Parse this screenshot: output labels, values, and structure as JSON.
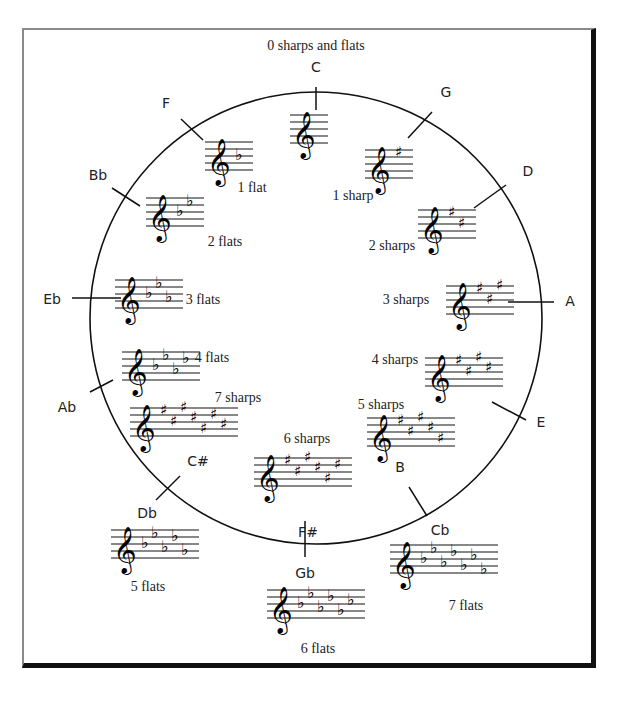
{
  "title": "0 sharps and flats",
  "circle": {
    "cx": 316,
    "cy": 318,
    "r": 226,
    "stroke": "#111111"
  },
  "keys": [
    {
      "name": "C",
      "label_x": 316,
      "label_y": 72,
      "tick": [
        316,
        87,
        316,
        110
      ],
      "staff_x": 290,
      "staff_y": 115,
      "acc_type": "none",
      "acc_count": 0,
      "count_label": "",
      "count_x": 0,
      "count_y": 0
    },
    {
      "name": "G",
      "label_x": 446,
      "label_y": 97,
      "tick": [
        432,
        112,
        408,
        138
      ],
      "staff_x": 365,
      "staff_y": 150,
      "acc_type": "sharp",
      "acc_count": 1,
      "count_label": "1 sharp",
      "count_x": 353,
      "count_y": 200
    },
    {
      "name": "D",
      "label_x": 528,
      "label_y": 176,
      "tick": [
        506,
        185,
        474,
        208
      ],
      "staff_x": 418,
      "staff_y": 210,
      "acc_type": "sharp",
      "acc_count": 2,
      "count_label": "2 sharps",
      "count_x": 392,
      "count_y": 250
    },
    {
      "name": "A",
      "label_x": 570,
      "label_y": 306,
      "tick": [
        508,
        302,
        554,
        302
      ],
      "staff_x": 446,
      "staff_y": 286,
      "acc_type": "sharp",
      "acc_count": 3,
      "count_label": "3 sharps",
      "count_x": 406,
      "count_y": 304
    },
    {
      "name": "E",
      "label_x": 541,
      "label_y": 427,
      "tick": [
        492,
        402,
        526,
        420
      ],
      "staff_x": 425,
      "staff_y": 358,
      "acc_type": "sharp",
      "acc_count": 4,
      "count_label": "4 sharps",
      "count_x": 395,
      "count_y": 364
    },
    {
      "name": "B",
      "label_x": 400,
      "label_y": 472,
      "tick": [
        0,
        0,
        0,
        0
      ],
      "staff_x": 367,
      "staff_y": 418,
      "acc_type": "sharp",
      "acc_count": 5,
      "count_label": "5 sharps",
      "count_x": 381,
      "count_y": 409
    },
    {
      "name": "F#",
      "label_x": 308,
      "label_y": 537,
      "tick": [
        0,
        0,
        0,
        0
      ],
      "staff_x": 254,
      "staff_y": 458,
      "acc_type": "sharp",
      "acc_count": 6,
      "count_label": "6 sharps",
      "count_x": 307,
      "count_y": 443
    },
    {
      "name": "C#",
      "label_x": 198,
      "label_y": 466,
      "tick": [
        180,
        476,
        156,
        500
      ],
      "staff_x": 130,
      "staff_y": 408,
      "acc_type": "sharp",
      "acc_count": 7,
      "count_label": "7 sharps",
      "count_x": 238,
      "count_y": 402
    },
    {
      "name": "Cb",
      "label_x": 440,
      "label_y": 535,
      "tick": [
        409,
        487,
        427,
        516
      ],
      "staff_x": 390,
      "staff_y": 545,
      "acc_type": "flat",
      "acc_count": 7,
      "count_label": "7 flats",
      "count_x": 466,
      "count_y": 610
    },
    {
      "name": "Gb",
      "label_x": 305,
      "label_y": 578,
      "tick": [
        305,
        521,
        305,
        557
      ],
      "staff_x": 267,
      "staff_y": 590,
      "acc_type": "flat",
      "acc_count": 6,
      "count_label": "6 flats",
      "count_x": 318,
      "count_y": 653
    },
    {
      "name": "Db",
      "label_x": 147,
      "label_y": 518,
      "tick": [
        0,
        0,
        0,
        0
      ],
      "staff_x": 111,
      "staff_y": 530,
      "acc_type": "flat",
      "acc_count": 5,
      "count_label": "5 flats",
      "count_x": 148,
      "count_y": 591
    },
    {
      "name": "Ab",
      "label_x": 67,
      "label_y": 412,
      "tick": [
        90,
        392,
        113,
        380
      ],
      "staff_x": 122,
      "staff_y": 352,
      "acc_type": "flat",
      "acc_count": 4,
      "count_label": "4 flats",
      "count_x": 212,
      "count_y": 362
    },
    {
      "name": "Eb",
      "label_x": 52,
      "label_y": 304,
      "tick": [
        72,
        298,
        121,
        298
      ],
      "staff_x": 115,
      "staff_y": 280,
      "acc_type": "flat",
      "acc_count": 3,
      "count_label": "3 flats",
      "count_x": 203,
      "count_y": 304
    },
    {
      "name": "Bb",
      "label_x": 98,
      "label_y": 180,
      "tick": [
        112,
        188,
        140,
        206
      ],
      "staff_x": 146,
      "staff_y": 198,
      "acc_type": "flat",
      "acc_count": 2,
      "count_label": "2 flats",
      "count_x": 225,
      "count_y": 246
    },
    {
      "name": "F",
      "label_x": 166,
      "label_y": 108,
      "tick": [
        181,
        119,
        203,
        140
      ],
      "staff_x": 205,
      "staff_y": 142,
      "acc_type": "flat",
      "acc_count": 1,
      "count_label": "1 flat",
      "count_x": 252,
      "count_y": 192
    }
  ],
  "glyphs": {
    "clef": "𝄞",
    "sharp": "♯",
    "flat": "♭"
  }
}
